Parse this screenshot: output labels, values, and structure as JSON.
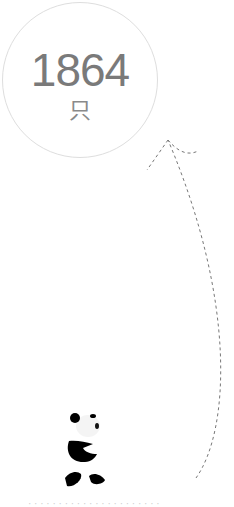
{
  "counter": {
    "value": "1864",
    "unit": "只"
  },
  "icons": {
    "path": "dashed-arrow-path-icon",
    "panda": "panda-icon"
  },
  "colors": {
    "count_text": "#7a7a7a",
    "circle_border": "#dedede",
    "dash": "#777777"
  },
  "footer": {
    "text": "· · · · · · · · · · · · · · · · · · · · · ·"
  }
}
